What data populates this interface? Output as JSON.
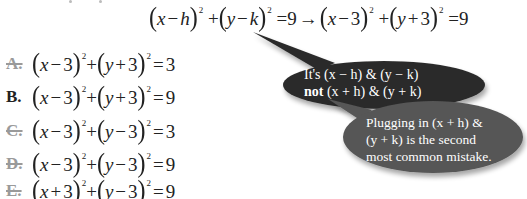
{
  "header": {
    "general_form": {
      "x_term": "x",
      "minus1": "−",
      "h": "h",
      "y_term": "y",
      "minus2": "−",
      "k": "k",
      "exp": "2",
      "plus": "+",
      "equals": "=",
      "rhs": "9"
    },
    "arrow": "→",
    "substituted": {
      "x_term": "x",
      "op1": "−",
      "a": "3",
      "y_term": "y",
      "op2": "+",
      "b": "3",
      "exp": "2",
      "plus": "+",
      "equals": "=",
      "rhs": "9"
    }
  },
  "options": [
    {
      "letter": "A.",
      "struck": true,
      "x_op": "−",
      "x_val": "3",
      "y_op": "+",
      "y_val": "3",
      "exp": "2",
      "rhs": "3"
    },
    {
      "letter": "B.",
      "struck": false,
      "x_op": "−",
      "x_val": "3",
      "y_op": "+",
      "y_val": "3",
      "exp": "2",
      "rhs": "9"
    },
    {
      "letter": "C.",
      "struck": true,
      "x_op": "−",
      "x_val": "3",
      "y_op": "−",
      "y_val": "3",
      "exp": "2",
      "rhs": "3"
    },
    {
      "letter": "D.",
      "struck": true,
      "x_op": "−",
      "x_val": "3",
      "y_op": "−",
      "y_val": "3",
      "exp": "2",
      "rhs": "9"
    },
    {
      "letter": "E.",
      "struck": true,
      "x_op": "+",
      "x_val": "3",
      "y_op": "−",
      "y_val": "3",
      "exp": "2",
      "rhs": "9"
    }
  ],
  "callouts": {
    "first": {
      "line1_prefix": "It's ",
      "line1_expr1": "(x − h)",
      "line1_amp": " & ",
      "line1_expr2": "(y − k)",
      "line2_bold": "not",
      "line2_expr1": " (x + h)",
      "line2_amp": " & ",
      "line2_expr2": "(y + k)",
      "color": "#2b2b2b"
    },
    "second": {
      "line1": "Plugging in (x + h) &",
      "line2": "(y + k) is the second",
      "line3": "most common mistake.",
      "color": "#565656"
    }
  },
  "colors": {
    "struck_letter": "#9a9a9a",
    "text": "#222222",
    "bubble_text": "#ffffff"
  }
}
